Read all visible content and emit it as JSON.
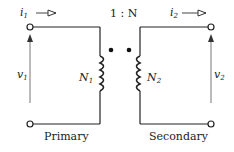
{
  "diagram": {
    "type": "ideal-transformer-circuit",
    "ratio_label": "1 : N",
    "primary": {
      "current_label": "i",
      "current_sub": "1",
      "voltage_label": "v",
      "voltage_sub": "1",
      "turns_label": "N",
      "turns_sub": "1",
      "caption": "Primary"
    },
    "secondary": {
      "current_label": "i",
      "current_sub": "2",
      "voltage_label": "v",
      "voltage_sub": "2",
      "turns_label": "N",
      "turns_sub": "2",
      "caption": "Secondary"
    },
    "colors": {
      "wire": "#222222",
      "arrow": "#555555",
      "background": "#ffffff"
    }
  }
}
